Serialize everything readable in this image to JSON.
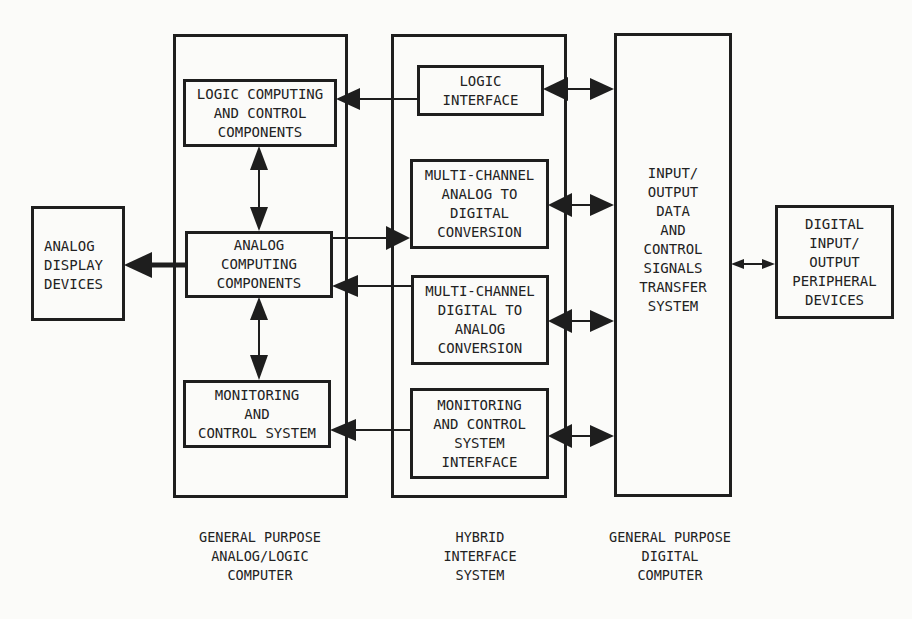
{
  "diagram": {
    "type": "block-diagram",
    "subsystems": [
      {
        "id": "analog_computer",
        "caption": "GENERAL PURPOSE\nANALOG/LOGIC\nCOMPUTER"
      },
      {
        "id": "hybrid_interface",
        "caption": "HYBRID\nINTERFACE\nSYSTEM"
      },
      {
        "id": "digital_computer",
        "caption": "GENERAL PURPOSE\nDIGITAL\nCOMPUTER"
      }
    ],
    "blocks": {
      "analog_display": "ANALOG\nDISPLAY\nDEVICES",
      "logic_computing": "LOGIC COMPUTING\nAND  CONTROL\nCOMPONENTS",
      "analog_computing": "ANALOG\nCOMPUTING\nCOMPONENTS",
      "monitoring_control": "MONITORING\nAND\nCONTROL SYSTEM",
      "logic_interface": "LOGIC\nINTERFACE",
      "adc": "MULTI-CHANNEL\nANALOG TO\nDIGITAL\nCONVERSION",
      "dac": "MULTI-CHANNEL\nDIGITAL TO\nANALOG\nCONVERSION",
      "monitor_interface": "MONITORING\nAND CONTROL\nSYSTEM\nINTERFACE",
      "io_transfer": "INPUT/\nOUTPUT\nDATA\nAND\nCONTROL\nSIGNALS\nTRANSFER\nSYSTEM",
      "digital_peripherals": "DIGITAL\nINPUT/\nOUTPUT\nPERIPHERAL\nDEVICES"
    },
    "connections": [
      {
        "from": "logic_interface",
        "to": "logic_computing",
        "direction": "one-way"
      },
      {
        "from": "logic_computing",
        "to": "analog_computing",
        "direction": "two-way"
      },
      {
        "from": "analog_computing",
        "to": "monitoring_control",
        "direction": "two-way"
      },
      {
        "from": "analog_computing",
        "to": "analog_display",
        "direction": "one-way"
      },
      {
        "from": "analog_computing",
        "to": "adc",
        "direction": "one-way"
      },
      {
        "from": "dac",
        "to": "analog_computing",
        "direction": "one-way"
      },
      {
        "from": "monitor_interface",
        "to": "monitoring_control",
        "direction": "one-way"
      },
      {
        "from": "logic_interface",
        "to": "io_transfer",
        "direction": "two-way"
      },
      {
        "from": "adc",
        "to": "io_transfer",
        "direction": "two-way"
      },
      {
        "from": "dac",
        "to": "io_transfer",
        "direction": "two-way"
      },
      {
        "from": "monitor_interface",
        "to": "io_transfer",
        "direction": "two-way"
      },
      {
        "from": "io_transfer",
        "to": "digital_peripherals",
        "direction": "two-way"
      }
    ]
  }
}
